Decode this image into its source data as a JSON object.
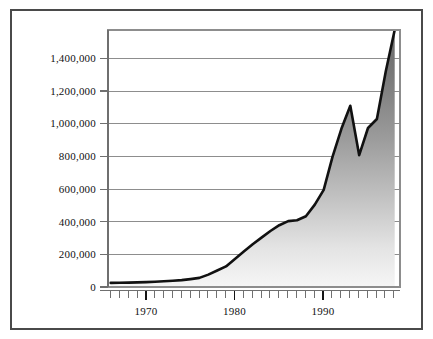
{
  "figure": {
    "frame_color": "#4a4a4a",
    "background": "#ffffff",
    "line_color": "#111111",
    "grid_color": "#8d8d8d",
    "fill_top_color": "#6e6e6e",
    "fill_bottom_color": "#f2f2f2"
  },
  "chart_data": {
    "type": "area",
    "title": "",
    "subtitle": "",
    "xlabel": "",
    "ylabel": "",
    "xlim": [
      1965.7,
      1998.6
    ],
    "ylim": [
      0,
      1560000
    ],
    "grid": true,
    "legend": null,
    "y_ticks": [
      0,
      200000,
      400000,
      600000,
      800000,
      1000000,
      1200000,
      1400000
    ],
    "y_tick_labels": [
      "0",
      "200,000",
      "400,000",
      "600,000",
      "800,000",
      "1,000,000",
      "1,200,000",
      "1,400,000"
    ],
    "x_major_ticks": [
      1970,
      1980,
      1990
    ],
    "x_major_tick_labels": [
      "1970",
      "1980",
      "1990"
    ],
    "x_minor_tick_interval": 1,
    "x": [
      1966,
      1967,
      1968,
      1969,
      1970,
      1971,
      1972,
      1973,
      1974,
      1975,
      1976,
      1977,
      1978,
      1979,
      1980,
      1981,
      1982,
      1983,
      1984,
      1985,
      1986,
      1987,
      1988,
      1989,
      1990,
      1991,
      1992,
      1993,
      1994,
      1995,
      1996,
      1997,
      1998
    ],
    "values": [
      25000,
      26000,
      27000,
      28000,
      30000,
      32000,
      35000,
      38000,
      42000,
      48000,
      55000,
      75000,
      100000,
      125000,
      170000,
      215000,
      260000,
      300000,
      340000,
      375000,
      400000,
      405000,
      430000,
      500000,
      590000,
      790000,
      960000,
      1100000,
      800000,
      965000,
      1020000,
      1310000,
      1560000
    ]
  }
}
